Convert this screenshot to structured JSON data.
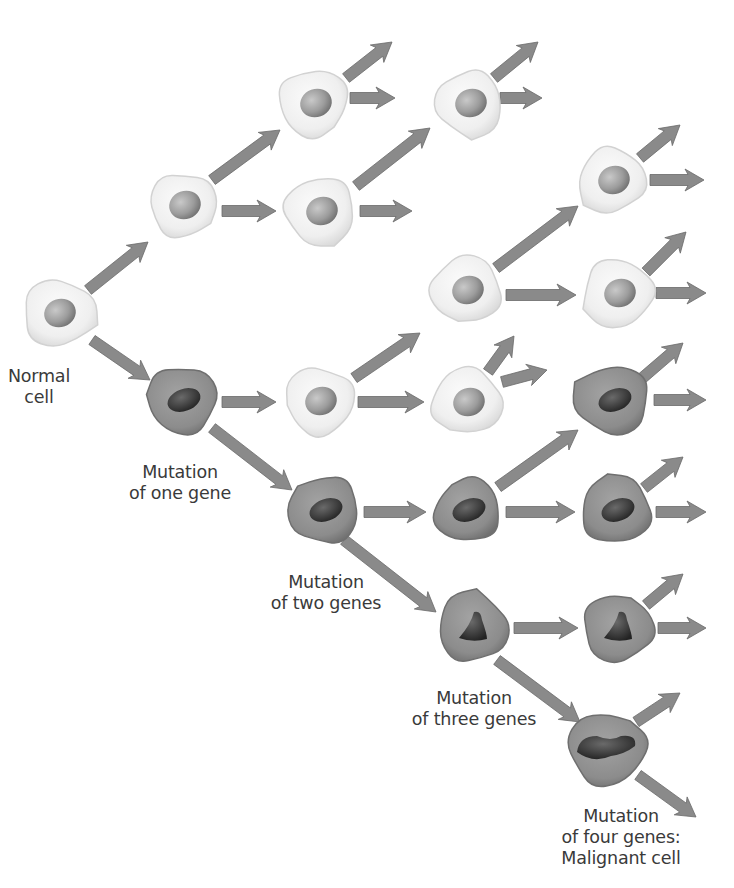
{
  "diagram": {
    "colors": {
      "background": "#ffffff",
      "normal_cell_fill": "#f2f2f2",
      "normal_cell_edge": "#d2d2d2",
      "normal_nucleus": "#9a9a9a",
      "mutant_cell_fill": "#8e8e8e",
      "mutant_cell_edge": "#6f6f6f",
      "mutant_nucleus": "#3c3c3c",
      "arrow_fill": "#8a8a8a",
      "arrow_edge": "#6a6a6a",
      "label_text": "#3a3a3a"
    },
    "labels": {
      "normal_cell": [
        "Normal",
        "cell"
      ],
      "one_gene": [
        "Mutation",
        "of one gene"
      ],
      "two_genes": [
        "Mutation",
        "of two genes"
      ],
      "three_genes": [
        "Mutation",
        "of three genes"
      ],
      "four_genes": [
        "Mutation",
        "of four genes:",
        "Malignant cell"
      ]
    },
    "cells": [
      {
        "id": "normal-root",
        "x": 58,
        "y": 313,
        "r": 40,
        "type": "normal",
        "nucleus": "oval"
      },
      {
        "id": "gen1-normal",
        "x": 183,
        "y": 205,
        "r": 38,
        "type": "normal",
        "nucleus": "oval"
      },
      {
        "id": "gen2-normal-a",
        "x": 314,
        "y": 103,
        "r": 40,
        "type": "normal",
        "nucleus": "oval"
      },
      {
        "id": "gen2-normal-b",
        "x": 320,
        "y": 211,
        "r": 40,
        "type": "normal",
        "nucleus": "oval"
      },
      {
        "id": "gen3-normal-a",
        "x": 469,
        "y": 103,
        "r": 38,
        "type": "normal",
        "nucleus": "oval"
      },
      {
        "id": "gen3-normal-c",
        "x": 466,
        "y": 290,
        "r": 40,
        "type": "normal",
        "nucleus": "oval"
      },
      {
        "id": "gen3-normal-d",
        "x": 467,
        "y": 402,
        "r": 40,
        "type": "normal",
        "nucleus": "oval"
      },
      {
        "id": "gen4-normal-a",
        "x": 612,
        "y": 180,
        "r": 38,
        "type": "normal",
        "nucleus": "oval"
      },
      {
        "id": "gen4-normal-b",
        "x": 618,
        "y": 293,
        "r": 40,
        "type": "normal",
        "nucleus": "oval"
      },
      {
        "id": "gen2-normal-c",
        "x": 319,
        "y": 401,
        "r": 40,
        "type": "normal",
        "nucleus": "oval"
      },
      {
        "id": "mut1",
        "x": 182,
        "y": 400,
        "r": 40,
        "type": "mutant",
        "nucleus": "oval"
      },
      {
        "id": "mut1-child",
        "x": 613,
        "y": 400,
        "r": 41,
        "type": "mutant",
        "nucleus": "oval"
      },
      {
        "id": "mut2",
        "x": 324,
        "y": 510,
        "r": 40,
        "type": "mutant",
        "nucleus": "oval"
      },
      {
        "id": "mut2-child-a",
        "x": 467,
        "y": 510,
        "r": 38,
        "type": "mutant",
        "nucleus": "oval"
      },
      {
        "id": "mut2-child-b",
        "x": 616,
        "y": 510,
        "r": 40,
        "type": "mutant",
        "nucleus": "oval"
      },
      {
        "id": "mut3",
        "x": 473,
        "y": 628,
        "r": 40,
        "type": "mutant",
        "nucleus": "triangle"
      },
      {
        "id": "mut3-child",
        "x": 618,
        "y": 628,
        "r": 40,
        "type": "mutant",
        "nucleus": "triangle"
      },
      {
        "id": "mut4-malignant",
        "x": 607,
        "y": 748,
        "r": 44,
        "type": "mutant",
        "nucleus": "blob"
      }
    ],
    "arrows": [
      {
        "from": [
          88,
          290
        ],
        "to": [
          148,
          242
        ]
      },
      {
        "from": [
          92,
          340
        ],
        "to": [
          150,
          380
        ]
      },
      {
        "from": [
          212,
          180
        ],
        "to": [
          280,
          130
        ]
      },
      {
        "from": [
          222,
          211
        ],
        "to": [
          276,
          211
        ]
      },
      {
        "from": [
          356,
          186
        ],
        "to": [
          430,
          128
        ]
      },
      {
        "from": [
          350,
          98
        ],
        "to": [
          395,
          98
        ]
      },
      {
        "from": [
          346,
          78
        ],
        "to": [
          392,
          42
        ]
      },
      {
        "from": [
          360,
          211
        ],
        "to": [
          412,
          211
        ]
      },
      {
        "from": [
          500,
          98
        ],
        "to": [
          542,
          98
        ]
      },
      {
        "from": [
          494,
          78
        ],
        "to": [
          538,
          42
        ]
      },
      {
        "from": [
          496,
          268
        ],
        "to": [
          578,
          206
        ]
      },
      {
        "from": [
          506,
          295
        ],
        "to": [
          576,
          295
        ]
      },
      {
        "from": [
          640,
          158
        ],
        "to": [
          680,
          125
        ]
      },
      {
        "from": [
          650,
          180
        ],
        "to": [
          704,
          180
        ]
      },
      {
        "from": [
          646,
          272
        ],
        "to": [
          686,
          232
        ]
      },
      {
        "from": [
          656,
          293
        ],
        "to": [
          706,
          293
        ]
      },
      {
        "from": [
          354,
          378
        ],
        "to": [
          420,
          333
        ]
      },
      {
        "from": [
          358,
          402
        ],
        "to": [
          424,
          402
        ]
      },
      {
        "from": [
          488,
          372
        ],
        "to": [
          514,
          336
        ]
      },
      {
        "from": [
          502,
          382
        ],
        "to": [
          547,
          370
        ]
      },
      {
        "from": [
          222,
          402
        ],
        "to": [
          276,
          402
        ]
      },
      {
        "from": [
          212,
          428
        ],
        "to": [
          292,
          490
        ]
      },
      {
        "from": [
          640,
          380
        ],
        "to": [
          683,
          343
        ]
      },
      {
        "from": [
          654,
          400
        ],
        "to": [
          706,
          400
        ]
      },
      {
        "from": [
          364,
          512
        ],
        "to": [
          426,
          512
        ]
      },
      {
        "from": [
          498,
          487
        ],
        "to": [
          578,
          430
        ]
      },
      {
        "from": [
          506,
          512
        ],
        "to": [
          575,
          512
        ]
      },
      {
        "from": [
          644,
          488
        ],
        "to": [
          683,
          457
        ]
      },
      {
        "from": [
          656,
          512
        ],
        "to": [
          706,
          512
        ]
      },
      {
        "from": [
          344,
          540
        ],
        "to": [
          436,
          612
        ]
      },
      {
        "from": [
          514,
          628
        ],
        "to": [
          578,
          628
        ]
      },
      {
        "from": [
          646,
          605
        ],
        "to": [
          683,
          574
        ]
      },
      {
        "from": [
          658,
          628
        ],
        "to": [
          706,
          628
        ]
      },
      {
        "from": [
          497,
          660
        ],
        "to": [
          580,
          722
        ]
      },
      {
        "from": [
          636,
          722
        ],
        "to": [
          680,
          693
        ]
      },
      {
        "from": [
          638,
          775
        ],
        "to": [
          696,
          817
        ]
      }
    ]
  }
}
